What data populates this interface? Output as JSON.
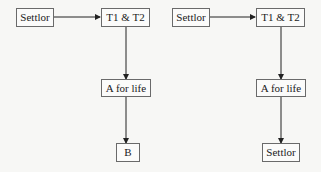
{
  "diagrams": [
    {
      "name": "left",
      "nodes": {
        "settlor": "Settlor",
        "trustees": "T1 & T2",
        "life_tenant": "A for life",
        "remainder": "B"
      }
    },
    {
      "name": "right",
      "nodes": {
        "settlor": "Settlor",
        "trustees": "T1 & T2",
        "life_tenant": "A for life",
        "remainder": "Settlor"
      }
    }
  ],
  "colors": {
    "background": "#f7f7f5",
    "border": "#6a6a6a",
    "arrow": "#222222",
    "text": "#1a1a1a"
  }
}
